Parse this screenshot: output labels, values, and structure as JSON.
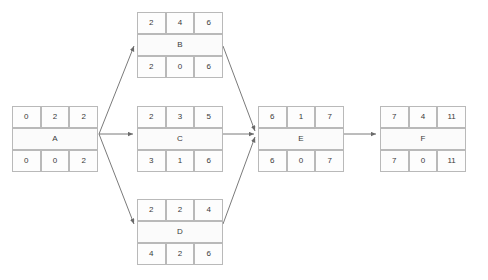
{
  "diagram": {
    "type": "activity-on-node-network",
    "background_color": "#ffffff",
    "node_border_color": "#b9b9b9",
    "edge_color": "#6b6b6b",
    "text_color": "#3a3a3a",
    "nodes": [
      {
        "id": "A",
        "label": "A",
        "top": [
          "0",
          "2",
          "2"
        ],
        "bottom": [
          "0",
          "0",
          "2"
        ],
        "x": 12,
        "y": 106
      },
      {
        "id": "B",
        "label": "B",
        "top": [
          "2",
          "4",
          "6"
        ],
        "bottom": [
          "2",
          "0",
          "6"
        ],
        "x": 137,
        "y": 12
      },
      {
        "id": "C",
        "label": "C",
        "top": [
          "2",
          "3",
          "5"
        ],
        "bottom": [
          "3",
          "1",
          "6"
        ],
        "x": 137,
        "y": 106
      },
      {
        "id": "D",
        "label": "D",
        "top": [
          "2",
          "2",
          "4"
        ],
        "bottom": [
          "4",
          "2",
          "6"
        ],
        "x": 137,
        "y": 199
      },
      {
        "id": "E",
        "label": "E",
        "top": [
          "6",
          "1",
          "7"
        ],
        "bottom": [
          "6",
          "0",
          "7"
        ],
        "x": 258,
        "y": 106
      },
      {
        "id": "F",
        "label": "F",
        "top": [
          "7",
          "4",
          "11"
        ],
        "bottom": [
          "7",
          "0",
          "11"
        ],
        "x": 380,
        "y": 106
      }
    ],
    "edges": [
      {
        "from": "A",
        "to": "B"
      },
      {
        "from": "A",
        "to": "C"
      },
      {
        "from": "A",
        "to": "D"
      },
      {
        "from": "B",
        "to": "E"
      },
      {
        "from": "C",
        "to": "E"
      },
      {
        "from": "D",
        "to": "E"
      },
      {
        "from": "E",
        "to": "F"
      }
    ]
  }
}
